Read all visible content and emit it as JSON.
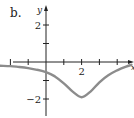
{
  "figure_label": "b.",
  "chart_data": {
    "type": "line",
    "title": "",
    "xlabel": "x",
    "ylabel": "y",
    "xlim": [
      -2.6,
      4.9
    ],
    "ylim": [
      -2.8,
      3.1
    ],
    "x_ticks": [
      -2,
      -1,
      0,
      1,
      2,
      3,
      4
    ],
    "x_tick_labels": [
      {
        "value": 2,
        "label": "2"
      }
    ],
    "y_ticks": [
      -2,
      -1,
      1,
      2
    ],
    "y_tick_labels": [
      {
        "value": 2,
        "label": "2"
      },
      {
        "value": -2,
        "label": "-2"
      }
    ],
    "grid": false,
    "legend": null,
    "series": [
      {
        "name": "f(x)",
        "color": "#8c8c8c",
        "x": [
          -2.6,
          -2,
          -1.5,
          -1,
          -0.5,
          0,
          0.5,
          1,
          1.5,
          2,
          2.5,
          3,
          3.5,
          4,
          4.5,
          4.8
        ],
        "y": [
          -0.2,
          -0.22,
          -0.27,
          -0.33,
          -0.42,
          -0.55,
          -0.78,
          -1.15,
          -1.6,
          -1.9,
          -1.6,
          -1.1,
          -0.72,
          -0.45,
          -0.25,
          -0.15
        ]
      }
    ]
  },
  "colors": {
    "axis": "#222222",
    "curve": "#8c8c8c",
    "background": "#ffffff"
  }
}
